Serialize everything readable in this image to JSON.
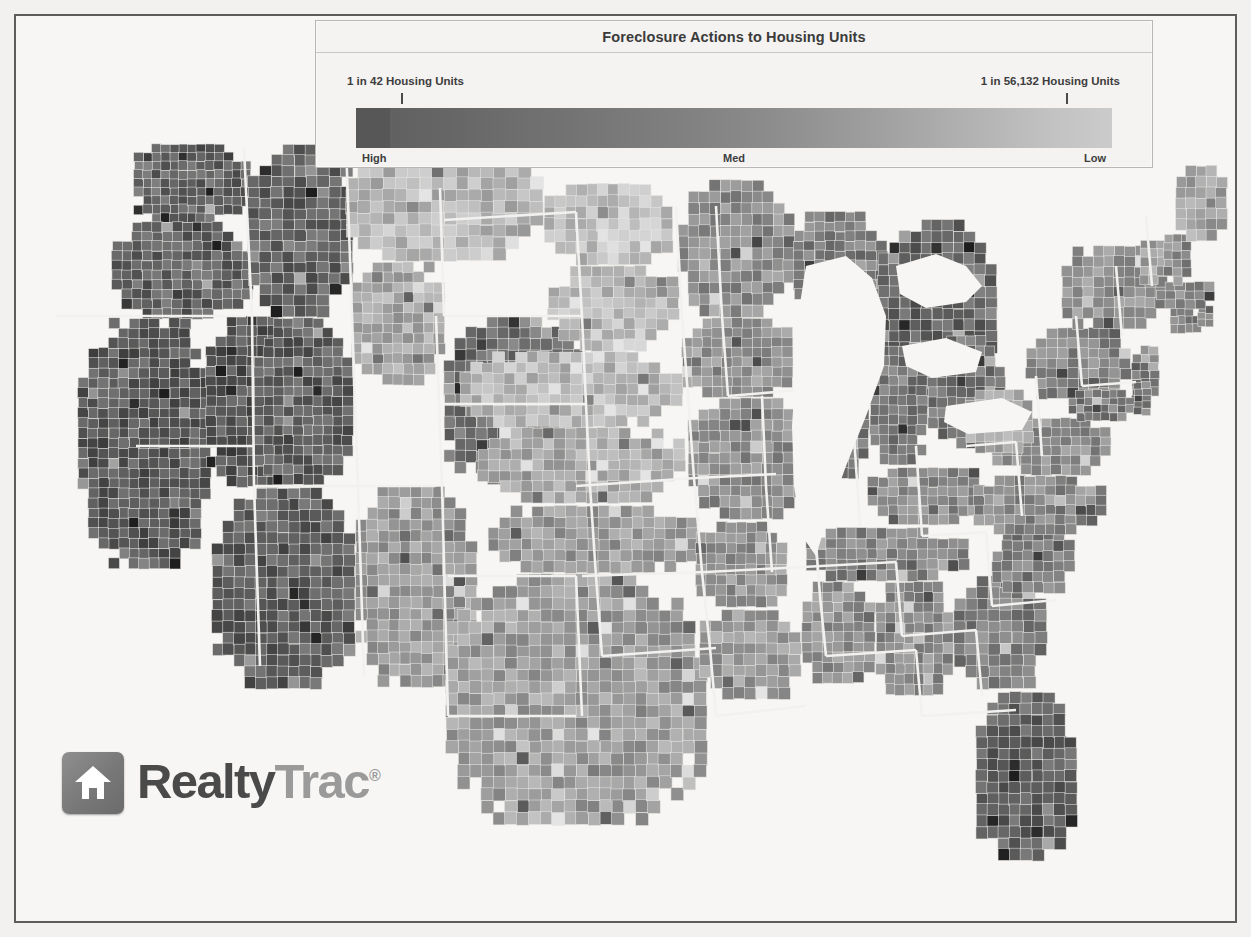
{
  "legend": {
    "title": "Foreclosure Actions to Housing Units",
    "high_value_label": "1 in 42 Housing Units",
    "low_value_label": "1 in 56,132 Housing Units",
    "zone_high": "High",
    "zone_med": "Med",
    "zone_low": "Low"
  },
  "logo": {
    "name_part1": "Realty",
    "name_part2": "Trac",
    "trademark": "®",
    "icon": "house-icon"
  },
  "chart_data": {
    "type": "heatmap",
    "title": "Foreclosure Actions to Housing Units",
    "subtitle": "",
    "map_region": "Continental United States, county level",
    "legend_position": "top-center",
    "scale": {
      "min_label": "1 in 42 Housing Units",
      "max_label": "1 in 56,132 Housing Units",
      "min_ratio_denominator": 42,
      "max_ratio_denominator": 56132,
      "direction": "dark = high foreclosure rate, light = low foreclosure rate",
      "zone_labels": [
        "High",
        "Med",
        "Low"
      ],
      "colors": [
        "#575757",
        "#6d6d6d",
        "#818181",
        "#939393",
        "#aaaaaa",
        "#c2c2c2",
        "#cbcbcb"
      ]
    },
    "regions": [
      {
        "name": "California",
        "level": "High",
        "shade": "#595959"
      },
      {
        "name": "Nevada",
        "level": "High",
        "shade": "#575757"
      },
      {
        "name": "Arizona",
        "level": "High",
        "shade": "#5e5e5e"
      },
      {
        "name": "Oregon",
        "level": "High",
        "shade": "#636363"
      },
      {
        "name": "Washington",
        "level": "High",
        "shade": "#656565"
      },
      {
        "name": "Idaho",
        "level": "High",
        "shade": "#636363"
      },
      {
        "name": "Utah",
        "level": "High",
        "shade": "#5f5f5f"
      },
      {
        "name": "Colorado",
        "level": "Med-High",
        "shade": "#737373"
      },
      {
        "name": "Montana",
        "level": "Low",
        "shade": "#b4b4b4"
      },
      {
        "name": "Wyoming",
        "level": "Med-Low",
        "shade": "#a8a8a8"
      },
      {
        "name": "North Dakota",
        "level": "Low",
        "shade": "#c0c0c0"
      },
      {
        "name": "South Dakota",
        "level": "Low",
        "shade": "#bcbcbc"
      },
      {
        "name": "Nebraska",
        "level": "Low",
        "shade": "#b8b8b8"
      },
      {
        "name": "Kansas",
        "level": "Med-Low",
        "shade": "#ababab"
      },
      {
        "name": "Oklahoma",
        "level": "Med",
        "shade": "#9b9b9b"
      },
      {
        "name": "Texas",
        "level": "Med",
        "shade": "#9e9e9e"
      },
      {
        "name": "New Mexico",
        "level": "Med",
        "shade": "#9a9a9a"
      },
      {
        "name": "Minnesota",
        "level": "Med",
        "shade": "#8e8e8e"
      },
      {
        "name": "Iowa",
        "level": "Med",
        "shade": "#959595"
      },
      {
        "name": "Missouri",
        "level": "Med",
        "shade": "#8d8d8d"
      },
      {
        "name": "Arkansas",
        "level": "Med",
        "shade": "#949494"
      },
      {
        "name": "Louisiana",
        "level": "Med",
        "shade": "#9a9a9a"
      },
      {
        "name": "Wisconsin",
        "level": "Med-High",
        "shade": "#7d7d7d"
      },
      {
        "name": "Illinois",
        "level": "Med-High",
        "shade": "#767676"
      },
      {
        "name": "Michigan",
        "level": "High",
        "shade": "#656565"
      },
      {
        "name": "Indiana",
        "level": "Med-High",
        "shade": "#767676"
      },
      {
        "name": "Ohio",
        "level": "Med-High",
        "shade": "#717171"
      },
      {
        "name": "Kentucky",
        "level": "Med",
        "shade": "#8a8a8a"
      },
      {
        "name": "Tennessee",
        "level": "Med",
        "shade": "#858585"
      },
      {
        "name": "Mississippi",
        "level": "Med",
        "shade": "#929292"
      },
      {
        "name": "Alabama",
        "level": "Med",
        "shade": "#8c8c8c"
      },
      {
        "name": "Georgia",
        "level": "Med-High",
        "shade": "#7b7b7b"
      },
      {
        "name": "Florida",
        "level": "High",
        "shade": "#636363"
      },
      {
        "name": "South Carolina",
        "level": "Med-High",
        "shade": "#7e7e7e"
      },
      {
        "name": "North Carolina",
        "level": "Med",
        "shade": "#8a8a8a"
      },
      {
        "name": "Virginia",
        "level": "Med",
        "shade": "#8e8e8e"
      },
      {
        "name": "West Virginia",
        "level": "Med-Low",
        "shade": "#a3a3a3"
      },
      {
        "name": "Pennsylvania",
        "level": "Med",
        "shade": "#868686"
      },
      {
        "name": "New York",
        "level": "Med",
        "shade": "#929292"
      },
      {
        "name": "New Jersey",
        "level": "Med-High",
        "shade": "#7a7a7a"
      },
      {
        "name": "Maryland",
        "level": "Med-High",
        "shade": "#7c7c7c"
      },
      {
        "name": "Delaware",
        "level": "Med-High",
        "shade": "#7a7a7a"
      },
      {
        "name": "Connecticut",
        "level": "Med-High",
        "shade": "#7d7d7d"
      },
      {
        "name": "Rhode Island",
        "level": "Med-High",
        "shade": "#787878"
      },
      {
        "name": "Massachusetts",
        "level": "Med",
        "shade": "#848484"
      },
      {
        "name": "Vermont",
        "level": "Med-Low",
        "shade": "#a0a0a0"
      },
      {
        "name": "New Hampshire",
        "level": "Med",
        "shade": "#8b8b8b"
      },
      {
        "name": "Maine",
        "level": "Med-Low",
        "shade": "#a5a5a5"
      }
    ]
  }
}
